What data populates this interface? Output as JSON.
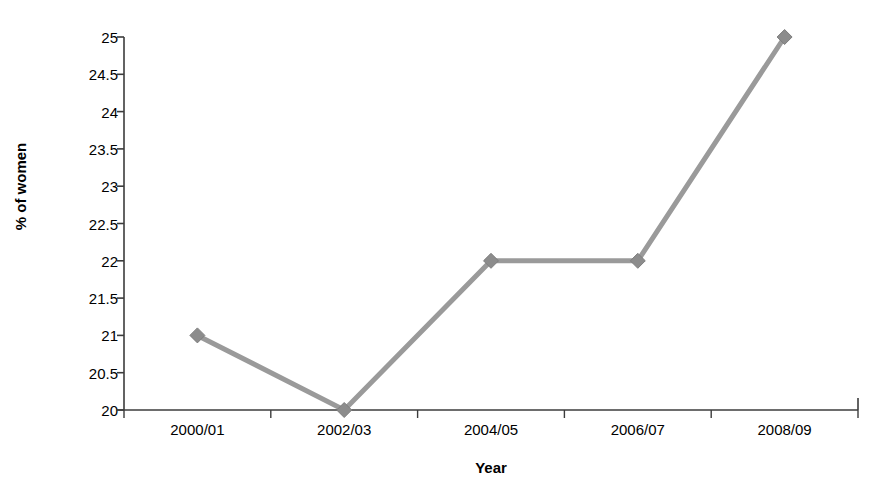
{
  "chart_data": {
    "type": "line",
    "title": "",
    "xlabel": "Year",
    "ylabel": "% of women",
    "categories": [
      "2000/01",
      "2002/03",
      "2004/05",
      "2006/07",
      "2008/09"
    ],
    "values": [
      21,
      20,
      22,
      22,
      25
    ],
    "series": [
      {
        "name": "% of women",
        "values": [
          21,
          20,
          22,
          22,
          25
        ]
      }
    ],
    "ylim": [
      20,
      25
    ],
    "ytick_step": 0.5,
    "yticks": [
      "25",
      "24.5",
      "24",
      "23.5",
      "23",
      "22.5",
      "22",
      "21.5",
      "21",
      "20.5",
      "20"
    ],
    "ytick_values": [
      25,
      24.5,
      24,
      23.5,
      23,
      22.5,
      22,
      21.5,
      21,
      20.5,
      20
    ],
    "grid": false,
    "legend": false,
    "legend_position": "none",
    "marker": "diamond",
    "line_color": "#9a9a9a",
    "marker_color": "#8c8c8c",
    "axis_color": "#3c3c3c",
    "background_color": "#ffffff"
  }
}
